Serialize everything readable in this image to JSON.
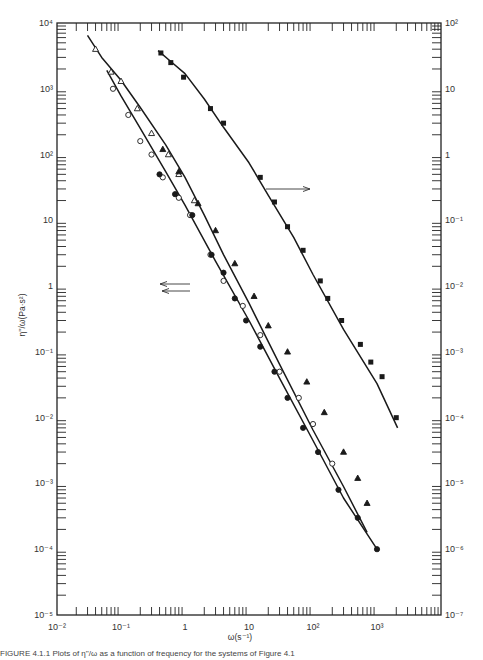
{
  "chart_data": {
    "type": "scatter",
    "title": "",
    "xlabel": "ω(s⁻¹)",
    "ylabel": "η''/ω(Pa·s²)",
    "x_scale": "log",
    "y_scale": "log",
    "xlim": [
      0.01,
      8000
    ],
    "ylim_left": [
      1e-05,
      10000.0
    ],
    "ylim_right": [
      1e-07,
      100.0
    ],
    "grid": false,
    "legend": "none",
    "x_ticks": [
      "10⁻²",
      "10⁻¹",
      "1",
      "10",
      "10²",
      "10³"
    ],
    "y_ticks_left": [
      "10⁻⁵",
      "10⁻⁴",
      "10⁻³",
      "10⁻²",
      "10⁻¹",
      "1",
      "10",
      "10²",
      "10³",
      "10⁴"
    ],
    "y_ticks_right": [
      "10⁻⁷",
      "10⁻⁶",
      "10⁻⁵",
      "10⁻⁴",
      "10⁻³",
      "10⁻²",
      "10⁻¹",
      "1",
      "10",
      "10²"
    ],
    "annotations": [
      {
        "type": "arrow",
        "direction": "right",
        "text": "",
        "meaning": "filled-square series read on right axis",
        "at": {
          "x": 20,
          "y_left": 30
        }
      },
      {
        "type": "arrow",
        "direction": "left",
        "text": "",
        "meaning": "series read on left axis",
        "at": {
          "x": 1.5,
          "y_left": 4.3
        }
      },
      {
        "type": "arrow",
        "direction": "left",
        "text": "",
        "meaning": "series read on left axis",
        "at": {
          "x": 1.5,
          "y_left": 3.4
        }
      }
    ],
    "series": [
      {
        "name": "open triangles",
        "marker": "triangle-open",
        "axis": "left",
        "x": [
          0.04,
          0.07,
          0.1,
          0.18,
          0.3,
          0.55,
          0.8,
          1.4
        ],
        "y": [
          4000,
          1800,
          1300,
          500,
          210,
          100,
          50,
          20
        ]
      },
      {
        "name": "open circles",
        "marker": "circle-open",
        "axis": "left",
        "x": [
          0.075,
          0.13,
          0.2,
          0.3,
          0.45,
          0.8,
          1.2,
          2.5,
          4,
          8,
          15,
          30,
          60,
          100,
          200
        ],
        "y": [
          1000,
          400,
          160,
          100,
          45,
          22,
          12,
          3,
          1.2,
          0.5,
          0.18,
          0.05,
          0.02,
          0.008,
          0.002
        ]
      },
      {
        "name": "filled circles",
        "marker": "circle-filled",
        "axis": "left",
        "x": [
          0.4,
          0.7,
          1.3,
          2.6,
          4,
          6,
          9,
          15,
          25,
          40,
          70,
          120,
          250,
          500,
          1000
        ],
        "y": [
          50,
          25,
          12,
          3,
          1.6,
          0.65,
          0.3,
          0.12,
          0.05,
          0.02,
          0.007,
          0.003,
          0.0008,
          0.0003,
          0.0001
        ]
      },
      {
        "name": "filled triangles",
        "marker": "triangle-filled",
        "axis": "left",
        "x": [
          0.45,
          0.8,
          1.6,
          3,
          6,
          12,
          20,
          40,
          80,
          150,
          300,
          500,
          700
        ],
        "y": [
          120,
          55,
          18,
          7,
          2.2,
          0.7,
          0.25,
          0.1,
          0.035,
          0.012,
          0.003,
          0.0012,
          0.0005
        ]
      },
      {
        "name": "filled squares",
        "marker": "square-filled",
        "axis": "right",
        "x": [
          0.42,
          0.6,
          0.95,
          2.5,
          4,
          15,
          25,
          40,
          70,
          130,
          170,
          280,
          550,
          800,
          1200,
          2000
        ],
        "y": [
          35,
          25,
          15,
          5,
          3,
          0.45,
          0.19,
          0.08,
          0.035,
          0.012,
          0.0065,
          0.003,
          0.0013,
          0.0007,
          0.00042,
          0.0001
        ]
      }
    ]
  },
  "axes": {
    "x_title": "ω(s⁻¹)",
    "y_title": "η''/ω(Pa·s²)",
    "x_tick_labels": [
      "10⁻²",
      "10⁻¹",
      "1",
      "10",
      "10²",
      "10³"
    ],
    "y_left_tick_labels": [
      "10⁴",
      "10³",
      "10²",
      "10",
      "1",
      "10⁻¹",
      "10⁻²",
      "10⁻³",
      "10⁻⁴",
      "10⁻⁵"
    ],
    "y_right_tick_labels": [
      "10²",
      "10",
      "1",
      "10⁻¹",
      "10⁻²",
      "10⁻³",
      "10⁻⁴",
      "10⁻⁵",
      "10⁻⁶",
      "10⁻⁷"
    ]
  },
  "caption": "FIGURE 4.1.1   Plots of η''/ω as a function of frequency for the systems of Figure 4.1"
}
